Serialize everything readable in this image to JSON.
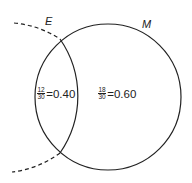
{
  "diagram": {
    "type": "venn",
    "circles": [
      {
        "label": "E",
        "style": "dashed outside, solid inside"
      },
      {
        "label": "M",
        "style": "solid"
      }
    ],
    "regions": [
      {
        "name": "E-and-M",
        "numerator": "12",
        "denominator": "30",
        "value": "=0.40"
      },
      {
        "name": "M-not-E",
        "numerator": "18",
        "denominator": "30",
        "value": "=0.60"
      }
    ]
  }
}
